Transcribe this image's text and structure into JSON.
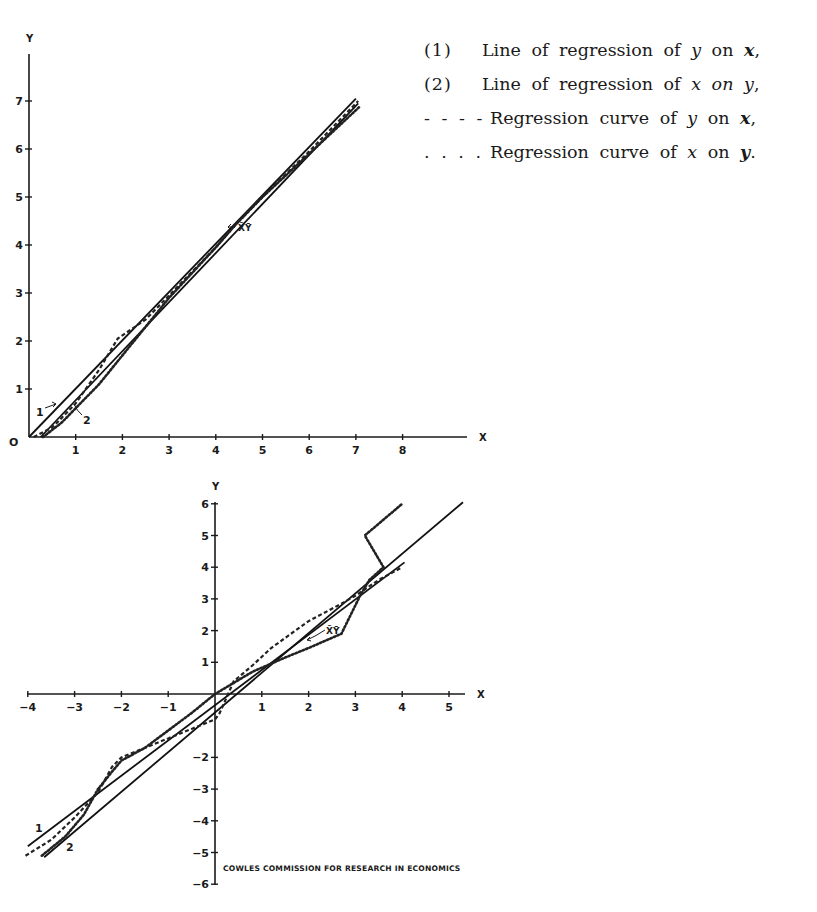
{
  "legend": {
    "items": [
      {
        "key": "(1)",
        "style": "solid",
        "parts": [
          [
            "t",
            "Line of regression of "
          ],
          [
            "i",
            "y"
          ],
          [
            "t",
            " on "
          ],
          [
            "b",
            "x"
          ],
          [
            "t",
            ","
          ]
        ]
      },
      {
        "key": "(2)",
        "style": "solid",
        "parts": [
          [
            "t",
            "Line of regression of "
          ],
          [
            "i",
            "x"
          ],
          [
            "t",
            " "
          ],
          [
            "i",
            "on"
          ],
          [
            "t",
            " "
          ],
          [
            "i",
            "y"
          ],
          [
            "t",
            ","
          ]
        ]
      },
      {
        "key": "- - - -",
        "style": "dashed",
        "parts": [
          [
            "t",
            "Regression curve of "
          ],
          [
            "i",
            "y"
          ],
          [
            "t",
            " on "
          ],
          [
            "b",
            "x"
          ],
          [
            "t",
            ","
          ]
        ]
      },
      {
        "key": ". . . .",
        "style": "dotted",
        "parts": [
          [
            "t",
            "Regression curve of "
          ],
          [
            "i",
            "x"
          ],
          [
            "t",
            " on "
          ],
          [
            "b",
            "y"
          ],
          [
            "t",
            "."
          ]
        ]
      }
    ]
  },
  "credit": "COWLES COMMISSION FOR RESEARCH IN ECONOMICS",
  "chart_data": [
    {
      "type": "line",
      "title": "",
      "xlabel": "X",
      "ylabel": "Y",
      "origin_label": "O",
      "xlim": [
        0,
        9.2
      ],
      "ylim": [
        0,
        8.0
      ],
      "xticks": [
        1,
        2,
        3,
        4,
        5,
        6,
        7,
        8
      ],
      "yticks": [
        1,
        2,
        3,
        4,
        5,
        6,
        7
      ],
      "grid": false,
      "frame": {
        "x0": 29,
        "y0": 437,
        "px_per_x": 46.7,
        "px_per_y": 48.0,
        "x_end": 467,
        "y_top": 54
      },
      "series": [
        {
          "name": "(1) Line of regression of y on x",
          "style": "solid",
          "label": "1",
          "x": [
            0.0,
            7.0
          ],
          "y": [
            0.0,
            7.05
          ]
        },
        {
          "name": "(2) Line of regression of x on y",
          "style": "solid",
          "label": "2",
          "x": [
            0.25,
            7.05
          ],
          "y": [
            0.0,
            6.95
          ]
        },
        {
          "name": "Regression curve of y on x",
          "style": "dashed",
          "x": [
            0.1,
            0.5,
            1.0,
            1.5,
            1.9,
            2.5,
            3.0,
            4.0,
            4.4,
            5.0,
            6.0,
            7.05
          ],
          "y": [
            0.0,
            0.2,
            0.7,
            1.4,
            2.05,
            2.45,
            2.95,
            3.95,
            4.4,
            5.0,
            5.95,
            7.0
          ]
        },
        {
          "name": "Regression curve of x on y",
          "style": "dotted",
          "x": [
            0.3,
            0.7,
            1.0,
            1.5,
            2.0,
            2.5,
            3.0,
            4.0,
            4.4,
            5.0,
            6.0,
            7.1
          ],
          "y": [
            0.0,
            0.3,
            0.6,
            1.1,
            1.7,
            2.3,
            2.9,
            3.95,
            4.4,
            5.0,
            5.9,
            6.9
          ]
        }
      ],
      "annotations": [
        {
          "text": "X̄Ȳ",
          "x": 4.4,
          "y": 4.4,
          "arrow": true
        },
        {
          "text": "1",
          "x": 0.2,
          "y": 0.55,
          "arrow": true
        },
        {
          "text": "2",
          "x": 1.2,
          "y": 0.35,
          "arrow": true
        }
      ]
    },
    {
      "type": "line",
      "title": "",
      "xlabel": "X",
      "ylabel": "Y",
      "xlim": [
        -4.0,
        5.3
      ],
      "ylim": [
        -6,
        6
      ],
      "xticks": [
        -4,
        -3,
        -2,
        -1,
        1,
        2,
        3,
        4,
        5
      ],
      "yticks": [
        6,
        5,
        4,
        3,
        2,
        1,
        -2,
        -3,
        -4,
        -5,
        -6
      ],
      "grid": false,
      "frame": {
        "x0": 215,
        "y0": 694,
        "px_per_x": 46.8,
        "px_per_y": 31.7,
        "x_start": 27,
        "x_end": 465,
        "y_top": 502,
        "y_bottom": 885
      },
      "series": [
        {
          "name": "(1) Line of regression of y on x",
          "style": "solid",
          "label": "1",
          "x": [
            -4.0,
            4.05
          ],
          "y": [
            -4.8,
            4.15
          ]
        },
        {
          "name": "(2) Line of regression of x on y",
          "style": "solid",
          "label": "2",
          "x": [
            -3.65,
            5.3
          ],
          "y": [
            -5.15,
            6.05
          ]
        },
        {
          "name": "Regression curve of y on x",
          "style": "dashed",
          "x": [
            -4.05,
            -3.5,
            -3.0,
            -2.5,
            -2.2,
            -2.0,
            -1.5,
            -1.0,
            -0.5,
            0.0,
            0.1,
            0.4,
            0.8,
            1.2,
            2.0,
            2.7,
            3.0,
            3.5,
            4.0
          ],
          "y": [
            -5.1,
            -4.6,
            -3.9,
            -3.1,
            -2.3,
            -2.0,
            -1.7,
            -1.4,
            -1.1,
            -0.8,
            -0.6,
            0.4,
            0.9,
            1.45,
            2.3,
            2.85,
            3.1,
            3.6,
            4.0
          ]
        },
        {
          "name": "Regression curve of x on y",
          "style": "dotted",
          "x": [
            -3.7,
            -3.2,
            -2.8,
            -2.5,
            -2.2,
            -2.0,
            -1.5,
            -1.0,
            -0.5,
            0.0,
            0.4,
            0.8,
            1.5,
            2.0,
            2.7,
            3.1,
            3.3,
            3.6,
            3.2,
            4.0
          ],
          "y": [
            -5.1,
            -4.5,
            -3.8,
            -3.0,
            -2.45,
            -2.1,
            -1.7,
            -1.15,
            -0.6,
            0.0,
            0.35,
            0.7,
            1.15,
            1.45,
            1.9,
            3.1,
            3.6,
            4.0,
            5.0,
            6.0
          ]
        }
      ],
      "annotations": [
        {
          "text": "X̄Ȳ",
          "x": 2.45,
          "y": 2.1,
          "arrow": true
        },
        {
          "text": "1",
          "x": -3.75,
          "y": -4.2
        },
        {
          "text": "2",
          "x": -3.1,
          "y": -4.85
        }
      ]
    }
  ]
}
